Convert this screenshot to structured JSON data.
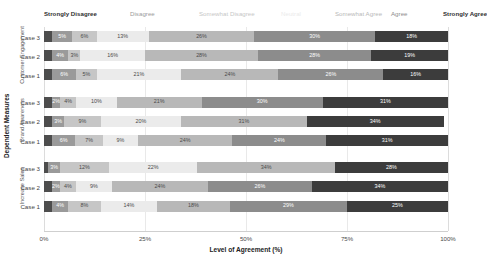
{
  "chart_data": {
    "type": "bar",
    "title": "",
    "xlabel": "Level of Agreement (%)",
    "ylabel": "Dependent Measures",
    "xlim": [
      0,
      100
    ],
    "xticks": [
      "0%",
      "25%",
      "50%",
      "75%",
      "100%"
    ],
    "xtick_values": [
      0,
      25,
      50,
      75,
      100
    ],
    "grid": true,
    "stacked": true,
    "orientation": "horizontal",
    "legend_position": "top",
    "categories": [
      "Strongly Disagree",
      "Disagree",
      "Somewhat Disagree",
      "Neutral",
      "Somewhat Agree",
      "Agree",
      "Strongly Agree"
    ],
    "colors": [
      "#4d4d4d",
      "#9a9a9a",
      "#c6c6c6",
      "#ebebeb",
      "#b8b8b8",
      "#8c8c8c",
      "#3c3c3c"
    ],
    "label_colors": [
      "#ffffff",
      "#ffffff",
      "#4a4a4a",
      "#4a4a4a",
      "#4a4a4a",
      "#ffffff",
      "#ffffff"
    ],
    "groups": [
      {
        "name": "Customer Engagement",
        "rows": [
          {
            "label": "Case 3",
            "values": [
              2,
              5,
              6,
              13,
              26,
              30,
              18
            ],
            "labels": [
              "",
              "5%",
              "6%",
              "13%",
              "26%",
              "30%",
              "18%"
            ]
          },
          {
            "label": "Case 2",
            "values": [
              2,
              4,
              3,
              16,
              28,
              28,
              19
            ],
            "labels": [
              "",
              "4%",
              "3%",
              "16%",
              "28%",
              "28%",
              "19%"
            ]
          },
          {
            "label": "Case 1",
            "values": [
              2,
              6,
              5,
              21,
              24,
              26,
              16
            ],
            "labels": [
              "",
              "6%",
              "5%",
              "21%",
              "24%",
              "26%",
              "16%"
            ]
          }
        ]
      },
      {
        "name": "Brand Awareness",
        "rows": [
          {
            "label": "Case 3",
            "values": [
              2,
              2,
              4,
              10,
              21,
              30,
              31
            ],
            "labels": [
              "",
              "2%",
              "4%",
              "10%",
              "21%",
              "30%",
              "31%"
            ]
          },
          {
            "label": "Case 2",
            "values": [
              2,
              3,
              9,
              20,
              31,
              0,
              34
            ],
            "labels": [
              "",
              "3%",
              "9%",
              "20%",
              "31%",
              "",
              "34%"
            ]
          },
          {
            "label": "Case 1",
            "values": [
              2,
              6,
              7,
              9,
              24,
              24,
              31
            ],
            "labels": [
              "",
              "6%",
              "7%",
              "9%",
              "24%",
              "24%",
              "31%"
            ]
          }
        ]
      },
      {
        "name": "Increase Sales",
        "rows": [
          {
            "label": "Case 3",
            "values": [
              1,
              3,
              12,
              22,
              34,
              0,
              28
            ],
            "labels": [
              "",
              "3%",
              "12%",
              "22%",
              "34%",
              "",
              "28%"
            ]
          },
          {
            "label": "Case 2",
            "values": [
              2,
              2,
              4,
              9,
              24,
              26,
              34
            ],
            "labels": [
              "",
              "2%",
              "4%",
              "9%",
              "24%",
              "26%",
              "34%"
            ]
          },
          {
            "label": "Case 1",
            "values": [
              2,
              4,
              8,
              14,
              18,
              29,
              25
            ],
            "labels": [
              "",
              "4%",
              "8%",
              "14%",
              "18%",
              "29%",
              "25%"
            ]
          }
        ]
      }
    ]
  }
}
